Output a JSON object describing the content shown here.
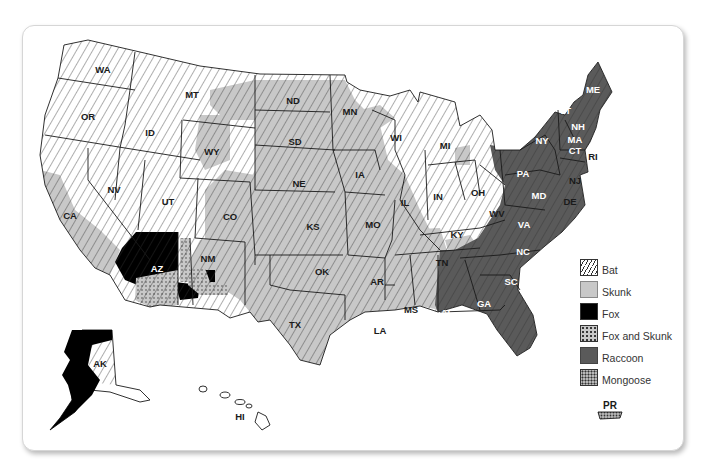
{
  "legend": {
    "items": [
      {
        "key": "bat",
        "label": "Bat"
      },
      {
        "key": "skunk",
        "label": "Skunk"
      },
      {
        "key": "fox",
        "label": "Fox"
      },
      {
        "key": "fox_skunk",
        "label": "Fox and Skunk"
      },
      {
        "key": "raccoon",
        "label": "Raccoon"
      },
      {
        "key": "mongoose",
        "label": "Mongoose"
      }
    ]
  },
  "colors": {
    "skunk": "#c8c8c8",
    "fox": "#000000",
    "raccoon": "#5a5a5a",
    "hatch": "#333333",
    "outline": "#1a1a1a"
  },
  "states": {
    "WA": "WA",
    "OR": "OR",
    "CA": "CA",
    "NV": "NV",
    "ID": "ID",
    "MT": "MT",
    "WY": "WY",
    "UT": "UT",
    "AZ": "AZ",
    "CO": "CO",
    "NM": "NM",
    "ND": "ND",
    "SD": "SD",
    "NE": "NE",
    "KS": "KS",
    "OK": "OK",
    "TX": "TX",
    "MN": "MN",
    "IA": "IA",
    "MO": "MO",
    "AR": "AR",
    "LA": "LA",
    "WI": "WI",
    "IL": "IL",
    "MS": "MS",
    "MI": "MI",
    "IN": "IN",
    "KY": "KY",
    "TN": "TN",
    "AL": "AL",
    "OH": "OH",
    "WV": "WV",
    "GA": "GA",
    "FL": "FL",
    "SC": "SC",
    "NC": "NC",
    "VA": "VA",
    "PA": "PA",
    "NY": "NY",
    "MD": "MD",
    "DE": "DE",
    "NJ": "NJ",
    "CT": "CT",
    "RI": "RI",
    "MA": "MA",
    "VT": "VT",
    "NH": "NH",
    "ME": "ME",
    "AK": "AK",
    "HI": "HI",
    "PR": "PR"
  }
}
